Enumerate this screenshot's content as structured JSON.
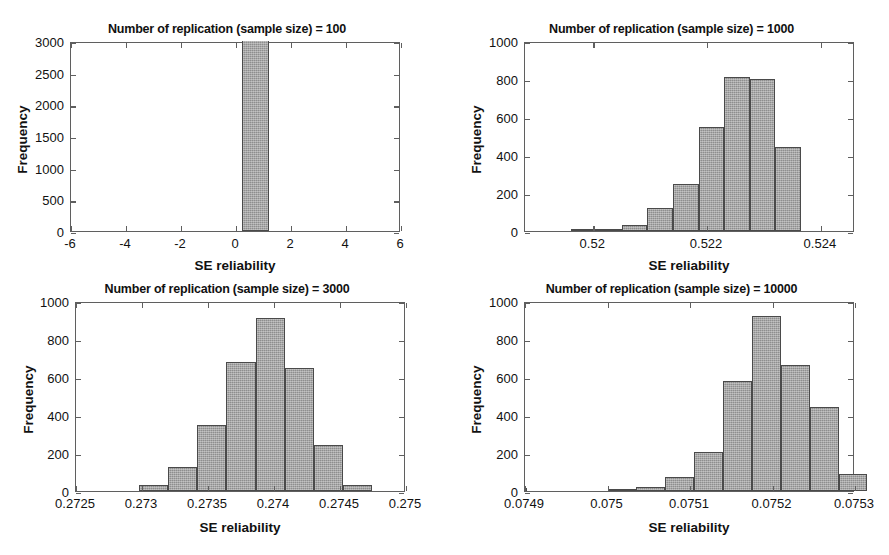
{
  "figure": {
    "background": "#ffffff",
    "bar_fill": "#8e8e8e",
    "bar_edge": "#4a4a4a",
    "axis_color": "#5f5f5f"
  },
  "chart_data": [
    {
      "type": "bar",
      "panel": "top-left",
      "title": "Number of replication (sample size) = 100",
      "xlabel": "SE reliability",
      "ylabel": "Frequency",
      "xlim": [
        -6,
        6
      ],
      "ylim": [
        0,
        3000
      ],
      "xticks": [
        -6,
        -4,
        -2,
        0,
        2,
        4,
        6
      ],
      "xtick_labels": [
        "-6",
        "-4",
        "-2",
        "0",
        "2",
        "4",
        "6"
      ],
      "yticks": [
        0,
        500,
        1000,
        1500,
        2000,
        2500,
        3000
      ],
      "ytick_labels": [
        "0",
        "500",
        "1000",
        "1500",
        "2000",
        "2500",
        "3000"
      ],
      "grid": false,
      "bin_edges": [
        0.2,
        1.2
      ],
      "values": [
        3000
      ],
      "note": "single tall bar clipped at axis top"
    },
    {
      "type": "bar",
      "panel": "top-right",
      "title": "Number of replication (sample size) = 1000",
      "xlabel": "SE reliability",
      "ylabel": "Frequency",
      "xlim": [
        0.5188,
        0.5246
      ],
      "ylim": [
        0,
        1000
      ],
      "xticks": [
        0.52,
        0.522,
        0.524
      ],
      "xtick_labels": [
        "0.52",
        "0.522",
        "0.524"
      ],
      "yticks": [
        0,
        200,
        400,
        600,
        800,
        1000
      ],
      "ytick_labels": [
        "0",
        "200",
        "400",
        "600",
        "800",
        "1000"
      ],
      "grid": false,
      "bin_edges": [
        0.5196,
        0.52005,
        0.5205,
        0.52095,
        0.5214,
        0.52185,
        0.5223,
        0.52275,
        0.5232
      ],
      "values": [
        2,
        8,
        30,
        120,
        245,
        550,
        812,
        798,
        440
      ]
    },
    {
      "type": "bar",
      "panel": "bottom-left",
      "title": "Number of replication (sample size) = 3000",
      "xlabel": "SE reliability",
      "ylabel": "Frequency",
      "xlim": [
        0.2725,
        0.275
      ],
      "ylim": [
        0,
        1000
      ],
      "xticks": [
        0.2725,
        0.273,
        0.2735,
        0.274,
        0.2745,
        0.275
      ],
      "xtick_labels": [
        "0.2725",
        "0.273",
        "0.2735",
        "0.274",
        "0.2745",
        "0.275"
      ],
      "yticks": [
        0,
        200,
        400,
        600,
        800,
        1000
      ],
      "ytick_labels": [
        "0",
        "200",
        "400",
        "600",
        "800",
        "1000"
      ],
      "grid": false,
      "bin_edges": [
        0.27298,
        0.2732,
        0.27342,
        0.27364,
        0.27386,
        0.27408,
        0.2743,
        0.27452
      ],
      "values": [
        30,
        125,
        350,
        680,
        910,
        650,
        240,
        30
      ]
    },
    {
      "type": "bar",
      "panel": "bottom-right",
      "title": "Number of replication (sample size) = 10000",
      "xlabel": "SE reliability",
      "ylabel": "Frequency",
      "xlim": [
        0.0749,
        0.0753
      ],
      "ylim": [
        0,
        1000
      ],
      "xticks": [
        0.0749,
        0.075,
        0.0751,
        0.0752,
        0.0753
      ],
      "xtick_labels": [
        "0.0749",
        "0.075",
        "0.0751",
        "0.0752",
        "0.0753"
      ],
      "yticks": [
        0,
        200,
        400,
        600,
        800,
        1000
      ],
      "ytick_labels": [
        "0",
        "200",
        "400",
        "600",
        "800",
        "1000"
      ],
      "grid": false,
      "bin_edges": [
        0.075,
        0.075035,
        0.07507,
        0.075105,
        0.07514,
        0.075175,
        0.07521,
        0.075245,
        0.07528
      ],
      "values": [
        10,
        20,
        75,
        205,
        580,
        920,
        665,
        440,
        90,
        15
      ]
    }
  ]
}
